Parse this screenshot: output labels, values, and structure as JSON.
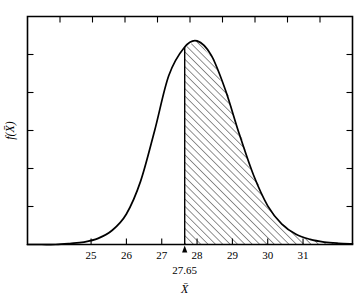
{
  "chart_data": {
    "type": "area",
    "title": "",
    "subtitle": "",
    "xlabel": "X̄",
    "ylabel": "f(X̄)",
    "x_ticks": [
      25,
      26,
      27,
      28,
      29,
      30,
      31
    ],
    "x_tick_labels": [
      "25",
      "26",
      "27",
      "28",
      "29",
      "30",
      "31"
    ],
    "xlim": [
      23.2,
      32.4
    ],
    "ylim": [
      0,
      1.12
    ],
    "y_ticks_count": 5,
    "y_tick_labels": [],
    "grid": false,
    "legend": null,
    "frame": "box",
    "tick_direction": "in",
    "curve": {
      "name": "sampling distribution of X-bar",
      "distribution": "normal-like skewed",
      "mean": 28.0,
      "peak_x": 28.0,
      "peak_y": 1.0,
      "std_dev": 0.62
    },
    "shaded_region": {
      "label": "shaded area (hatched)",
      "from_x": 27.65,
      "to_x": 32.4,
      "hatch_pattern": "diagonal-lines-45deg",
      "hatch_spacing_px": 4,
      "fill": "none",
      "stroke": "#000000"
    },
    "annotations": [
      {
        "name": "critical-value",
        "text": "27.65",
        "x": 27.65,
        "y": 0,
        "marker": "arrow-up",
        "position": "below-axis"
      }
    ],
    "series": [
      {
        "name": "f(X̄)",
        "x": [
          23.2,
          23.6,
          24.0,
          24.4,
          24.8,
          25.2,
          25.6,
          26.0,
          26.4,
          26.8,
          27.2,
          27.65,
          28.0,
          28.4,
          28.8,
          29.2,
          29.6,
          30.0,
          30.4,
          30.8,
          31.2,
          31.6,
          32.0,
          32.4
        ],
        "y": [
          0.0,
          0.0,
          0.0,
          0.005,
          0.012,
          0.03,
          0.07,
          0.15,
          0.31,
          0.56,
          0.83,
          0.97,
          1.0,
          0.93,
          0.76,
          0.54,
          0.34,
          0.19,
          0.1,
          0.05,
          0.025,
          0.012,
          0.006,
          0.003
        ]
      }
    ],
    "colors": {
      "axis": "#000000",
      "curve": "#000000",
      "hatch": "#000000",
      "background": "#ffffff"
    }
  },
  "figure": {
    "y_axis_title": "f(X̄)",
    "x_axis_title": "X̄",
    "critical_value_label": "27.65",
    "tick_labels": [
      "25",
      "26",
      "27",
      "28",
      "29",
      "30",
      "31"
    ]
  }
}
